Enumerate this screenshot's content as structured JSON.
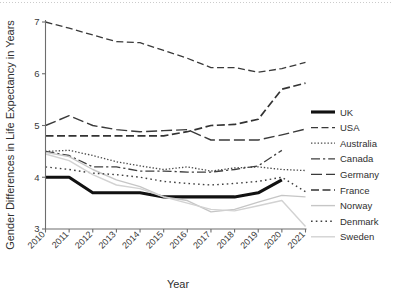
{
  "figure": {
    "name": "gender-life-expectancy-gap-line-chart"
  },
  "chart_data": {
    "type": "line",
    "title": "",
    "xlabel": "Year",
    "ylabel": "Gender Differences in Life Expectancy in Years",
    "x": [
      2010,
      2011,
      2012,
      2013,
      2014,
      2015,
      2016,
      2017,
      2018,
      2019,
      2020,
      2021
    ],
    "categories": [
      "2010",
      "2011",
      "2012",
      "2013",
      "2014",
      "2015",
      "2016",
      "2017",
      "2018",
      "2019",
      "2020",
      "2021"
    ],
    "xlim": [
      2010,
      2021
    ],
    "ylim": [
      3,
      7
    ],
    "yticks": [
      3,
      4,
      5,
      6,
      7
    ],
    "ytick_labels": [
      "3",
      "4",
      "5",
      "6",
      "7"
    ],
    "grid": false,
    "legend_position": "right",
    "series": [
      {
        "name": "UK",
        "style": "solid-thick",
        "color": "#111111",
        "width": 3.1,
        "dash": "",
        "values": [
          4.0,
          4.0,
          3.7,
          3.7,
          3.7,
          3.62,
          3.62,
          3.62,
          3.62,
          3.7,
          3.95,
          null
        ]
      },
      {
        "name": "USA",
        "style": "dashed",
        "color": "#3a3a3a",
        "width": 1.3,
        "dash": "7,3.5",
        "values": [
          7.0,
          6.88,
          6.75,
          6.62,
          6.6,
          6.45,
          6.3,
          6.12,
          6.12,
          6.03,
          6.1,
          6.22
        ]
      },
      {
        "name": "Australia",
        "style": "dotted",
        "color": "#4a4a4a",
        "width": 1.3,
        "dash": "1.4,1.9",
        "values": [
          4.5,
          4.52,
          4.42,
          4.3,
          4.22,
          4.15,
          4.2,
          4.12,
          4.18,
          4.2,
          4.15,
          4.13
        ]
      },
      {
        "name": "Canada",
        "style": "dash-dot",
        "color": "#3f3f3f",
        "width": 1.3,
        "dash": "9,3,2.2,3",
        "values": [
          4.5,
          4.42,
          4.2,
          4.2,
          4.12,
          4.12,
          4.1,
          4.1,
          4.15,
          4.22,
          4.52,
          null
        ]
      },
      {
        "name": "Germany",
        "style": "long-dash",
        "color": "#3a3a3a",
        "width": 1.4,
        "dash": "11,4",
        "values": [
          5.0,
          5.19,
          5.0,
          4.92,
          4.88,
          4.9,
          4.92,
          4.72,
          4.72,
          4.72,
          4.82,
          4.93
        ]
      },
      {
        "name": "France",
        "style": "dashed-medium",
        "color": "#333333",
        "width": 1.7,
        "dash": "8,3.5",
        "values": [
          4.8,
          4.8,
          4.8,
          4.8,
          4.8,
          4.8,
          4.88,
          5.0,
          5.02,
          5.12,
          5.7,
          5.82
        ]
      },
      {
        "name": "Norway",
        "style": "solid-light",
        "color": "#c6c6c6",
        "width": 1.4,
        "dash": "",
        "values": [
          4.48,
          4.4,
          4.15,
          3.95,
          3.82,
          3.62,
          3.55,
          3.33,
          3.38,
          3.52,
          3.65,
          3.62
        ]
      },
      {
        "name": "Denmark",
        "style": "dotted-loose",
        "color": "#3f3f3f",
        "width": 1.4,
        "dash": "1.6,3.2",
        "values": [
          4.2,
          4.15,
          4.08,
          4.05,
          4.0,
          3.92,
          3.88,
          3.85,
          3.88,
          3.92,
          4.0,
          3.72
        ]
      },
      {
        "name": "Sweden",
        "style": "solid-light2",
        "color": "#d2d2d2",
        "width": 1.4,
        "dash": "",
        "values": [
          4.45,
          4.32,
          4.05,
          3.85,
          3.78,
          3.62,
          3.5,
          3.38,
          3.35,
          3.45,
          3.55,
          3.05
        ]
      }
    ]
  },
  "legend": {
    "entries": [
      {
        "label": "UK"
      },
      {
        "label": "USA"
      },
      {
        "label": "Australia"
      },
      {
        "label": "Canada"
      },
      {
        "label": "Germany"
      },
      {
        "label": "France"
      },
      {
        "label": "Norway"
      },
      {
        "label": "Denmark"
      },
      {
        "label": "Sweden"
      }
    ]
  }
}
